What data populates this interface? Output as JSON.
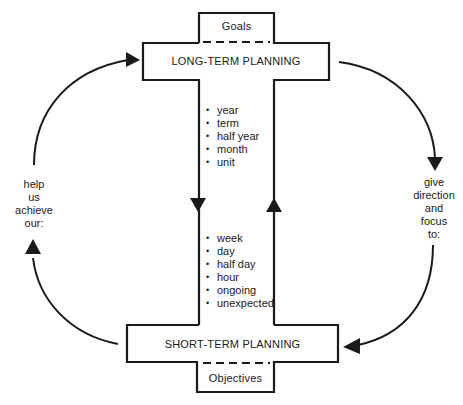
{
  "diagram": {
    "top": {
      "tab_label": "Goals",
      "box_label": "LONG-TERM PLANNING"
    },
    "bottom": {
      "tab_label": "Objectives",
      "box_label": "SHORT-TERM PLANNING"
    },
    "long_term_items": [
      "year",
      "term",
      "half year",
      "month",
      "unit"
    ],
    "short_term_items": [
      "week",
      "day",
      "half day",
      "hour",
      "ongoing",
      "unexpected"
    ],
    "left_cycle_label": [
      "help",
      "us",
      "achieve",
      "our:"
    ],
    "right_cycle_label": [
      "give",
      "direction",
      "and",
      "focus",
      "to:"
    ],
    "colors": {
      "line": "#1a1a1a",
      "background": "#ffffff"
    }
  }
}
